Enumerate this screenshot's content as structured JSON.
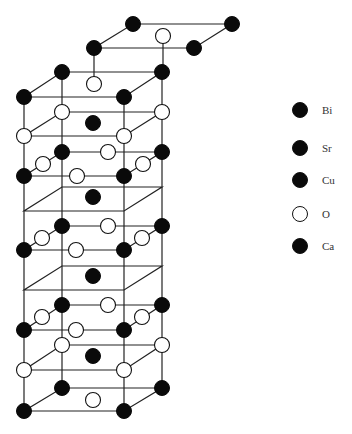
{
  "figure": {
    "colors": {
      "atom_filled": "#0a0a0a",
      "atom_open": "#ffffff",
      "bond": "#222222"
    }
  },
  "legend": {
    "items": [
      {
        "label": "Bi",
        "fill": "black"
      },
      {
        "label": "Sr",
        "fill": "black"
      },
      {
        "label": "Cu",
        "fill": "black"
      },
      {
        "label": "O",
        "fill": "white"
      },
      {
        "label": "Ca",
        "fill": "black"
      }
    ]
  }
}
